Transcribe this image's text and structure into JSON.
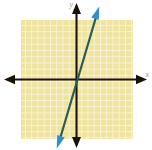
{
  "figure": {
    "width": 152,
    "height": 150,
    "background_color": "#ffffff"
  },
  "axes": {
    "x_label": "x",
    "y_label": "y",
    "axis_color": "#1a1208",
    "arrow_heads": [
      "left",
      "right",
      "up",
      "down"
    ],
    "origin_px": {
      "x": 76,
      "y": 80
    }
  },
  "grid": {
    "fill_color": "#efe3a2",
    "line_color": "#fdf8df",
    "cell_size_px": 6.25,
    "left_px": 21,
    "top_px": 20,
    "right_px": 133,
    "bottom_px": 139,
    "columns": 18,
    "rows": 19
  },
  "chart_data": {
    "type": "line",
    "title": "",
    "xlabel": "x",
    "ylabel": "y",
    "grid": true,
    "legend": "none",
    "xlim": [
      -8.8,
      9.1
    ],
    "ylim": [
      -9.4,
      9.6
    ],
    "unit_px": 6.25,
    "series": [
      {
        "name": "line",
        "color": "#2b5c52",
        "arrow_color": "#2f8fd0",
        "slope": 3,
        "intercept": 0,
        "equation": "y = 3x",
        "points": [
          {
            "x": -2.9,
            "y": -10.4
          },
          {
            "x": 0,
            "y": 0
          },
          {
            "x": 3.5,
            "y": 11.2
          }
        ],
        "endpoints_px": [
          {
            "x": 58,
            "y": 145
          },
          {
            "x": 98,
            "y": 10
          }
        ],
        "arrowheads": [
          "start",
          "end"
        ]
      }
    ]
  }
}
